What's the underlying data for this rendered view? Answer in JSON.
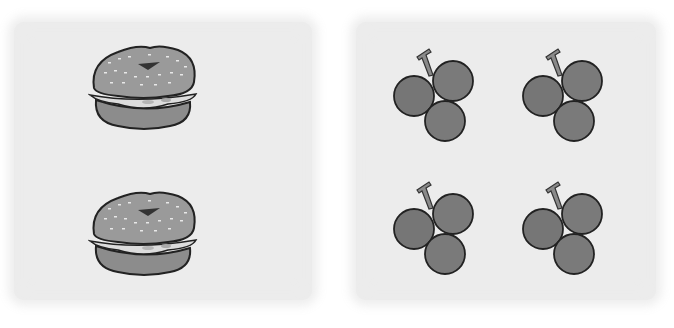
{
  "panels": [
    {
      "name": "bagels",
      "items": [
        {
          "type": "bagel-sandwich",
          "x": 88,
          "y": 42
        },
        {
          "type": "bagel-sandwich",
          "x": 88,
          "y": 188
        }
      ],
      "count": 2
    },
    {
      "name": "grapes",
      "items": [
        {
          "type": "grape-cluster",
          "x": 393,
          "y": 45
        },
        {
          "type": "grape-cluster",
          "x": 522,
          "y": 45
        },
        {
          "type": "grape-cluster",
          "x": 393,
          "y": 178
        },
        {
          "type": "grape-cluster",
          "x": 522,
          "y": 178
        }
      ],
      "count": 4
    }
  ],
  "colors": {
    "panel_bg": "#ececec",
    "bun": "#9a9a9a",
    "bun_bottom": "#8c8c8c",
    "filling": "#dcdcdc",
    "grape": "#7a7a7a",
    "stem": "#8a8a8a",
    "outline": "#222222"
  }
}
